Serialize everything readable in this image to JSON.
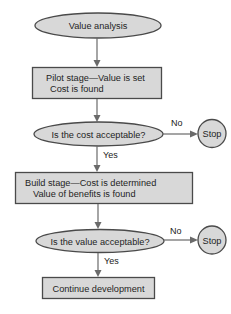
{
  "flowchart": {
    "start": {
      "label": "Value analysis"
    },
    "pilot_stage": {
      "line1": "Pilot stage—Value is set",
      "line2": "Cost is found"
    },
    "decision_cost": {
      "label": "Is the cost acceptable?",
      "yes_label": "Yes",
      "no_label": "No"
    },
    "stop_1": {
      "label": "Stop"
    },
    "build_stage": {
      "line1": "Build stage—Cost is determined",
      "line2": "Value of benefits is found"
    },
    "decision_value": {
      "label": "Is the value acceptable?",
      "yes_label": "Yes",
      "no_label": "No"
    },
    "stop_2": {
      "label": "Stop"
    },
    "end": {
      "label": "Continue development"
    }
  },
  "colors": {
    "shape_fill": "#d8d8d8",
    "shape_stroke": "#4a4a4a",
    "connector": "#6a6a6a",
    "text": "#1e1e1e"
  }
}
